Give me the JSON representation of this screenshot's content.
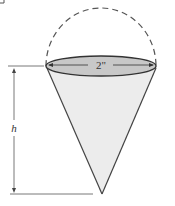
{
  "diagram": {
    "type": "cone-with-hemisphere",
    "labels": {
      "diameter": "2\"",
      "height": "h"
    },
    "colors": {
      "stroke": "#333333",
      "cone_fill": "#ececec",
      "top_fill": "#c8c8c8",
      "dashed": "#555555"
    }
  }
}
